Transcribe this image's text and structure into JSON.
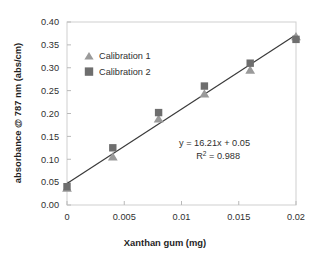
{
  "chart_data": {
    "type": "scatter",
    "title": "",
    "xlabel": "Xanthan gum (mg)",
    "ylabel": "absorbance @ 787 nm (abs/cm)",
    "xlim": [
      0,
      0.02
    ],
    "ylim": [
      0,
      0.4
    ],
    "xticks": [
      0,
      0.005,
      0.01,
      0.015,
      0.02
    ],
    "xtick_labels": [
      "0",
      "0.005",
      "0.01",
      "0.015",
      "0.02"
    ],
    "yticks": [
      0,
      0.05,
      0.1,
      0.15,
      0.2,
      0.25,
      0.3,
      0.35,
      0.4
    ],
    "ytick_labels": [
      "0.00",
      "0.05",
      "0.10",
      "0.15",
      "0.20",
      "0.25",
      "0.30",
      "0.35",
      "0.40"
    ],
    "grid": false,
    "legend_position": "upper-left-inside",
    "x": [
      0,
      0.004,
      0.008,
      0.012,
      0.016,
      0.02
    ],
    "series": [
      {
        "name": "Calibration 1",
        "marker": "triangle",
        "color": "#9a9a9a",
        "values": [
          0.037,
          0.105,
          0.188,
          0.243,
          0.295,
          0.368
        ]
      },
      {
        "name": "Calibration 2",
        "marker": "square",
        "color": "#6e6e6e",
        "values": [
          0.04,
          0.125,
          0.202,
          0.26,
          0.31,
          0.362
        ]
      }
    ],
    "trendline": {
      "slope": 16.21,
      "intercept": 0.05,
      "r_squared": 0.988,
      "color": "#3a3a3a",
      "x_start": 0,
      "y_start": 0.047,
      "x_end": 0.02,
      "y_end": 0.372
    },
    "annotations": {
      "equation": "y = 16.21x + 0.05",
      "r2_prefix": "R",
      "r2_exponent": "2",
      "r2_value": " = 0.988"
    },
    "colors": {
      "series1": "#9a9a9a",
      "series2": "#6e6e6e",
      "trendline": "#3a3a3a",
      "axis": "#b9b9b9",
      "plot_border": "#cfcfcf",
      "background": "#ffffff",
      "text": "#2f2f2f"
    }
  }
}
